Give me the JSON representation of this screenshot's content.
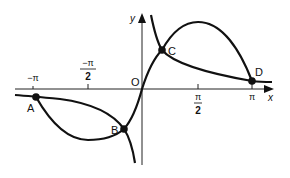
{
  "diagram": {
    "axes": {
      "x_label": "x",
      "y_label": "y",
      "origin_label": "O"
    },
    "ticks": [
      {
        "name": "neg-pi",
        "num": "−π",
        "den": ""
      },
      {
        "name": "neg-pi-over-2",
        "num": "−π",
        "den": "2"
      },
      {
        "name": "pi-over-2",
        "num": "π",
        "den": "2"
      },
      {
        "name": "pi",
        "num": "π",
        "den": ""
      }
    ],
    "points": [
      {
        "label": "A"
      },
      {
        "label": "B"
      },
      {
        "label": "C"
      },
      {
        "label": "D"
      }
    ],
    "curves": [
      {
        "name": "sine-curve"
      },
      {
        "name": "decreasing-curve"
      }
    ],
    "colors": {
      "stroke": "#111111",
      "background": "#ffffff"
    }
  }
}
